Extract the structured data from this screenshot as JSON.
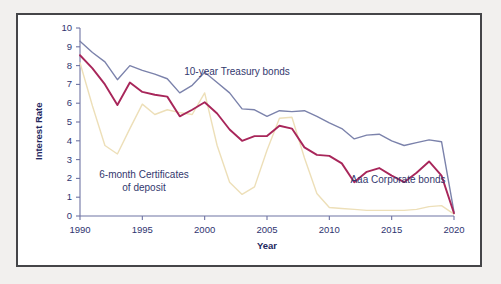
{
  "figure": {
    "background": "#f2f0ee",
    "panel_background": "#ffffff",
    "border_color": "#454548",
    "text_color": "#2f3470"
  },
  "chart_data": {
    "type": "line",
    "title": "",
    "xlabel": "Year",
    "ylabel": "Interest Rate",
    "xlim": [
      1990,
      2020
    ],
    "ylim": [
      0,
      10
    ],
    "xticks": [
      1990,
      1995,
      2000,
      2005,
      2010,
      2015,
      2020
    ],
    "xtick_labels": [
      "1990",
      "1995",
      "2000",
      "2005",
      "2010",
      "2015",
      "2020"
    ],
    "yticks": [
      0,
      1,
      2,
      3,
      4,
      5,
      6,
      7,
      8,
      9,
      10
    ],
    "ytick_labels": [
      "0",
      "1",
      "2",
      "3",
      "4",
      "5",
      "6",
      "7",
      "8",
      "9",
      "10"
    ],
    "grid": false,
    "legend_position": "inline-annotations",
    "x": [
      1990,
      1991,
      1992,
      1993,
      1994,
      1995,
      1996,
      1997,
      1998,
      1999,
      2000,
      2001,
      2002,
      2003,
      2004,
      2005,
      2006,
      2007,
      2008,
      2009,
      2010,
      2011,
      2012,
      2013,
      2014,
      2015,
      2016,
      2017,
      2018,
      2019,
      2020
    ],
    "series": [
      {
        "name": "10-year Treasury bonds",
        "color": "#7b82ab",
        "values": [
          9.3,
          8.7,
          8.2,
          7.25,
          8.0,
          7.75,
          7.55,
          7.3,
          6.55,
          6.95,
          7.65,
          7.1,
          6.55,
          5.7,
          5.65,
          5.3,
          5.6,
          5.55,
          5.6,
          5.3,
          4.95,
          4.65,
          4.1,
          4.3,
          4.35,
          4.0,
          3.75,
          3.9,
          4.05,
          3.95,
          0.2
        ]
      },
      {
        "name": "Aaa Corporate bonds",
        "color": "#a8265a",
        "values": [
          8.55,
          7.85,
          7.0,
          5.9,
          7.1,
          6.6,
          6.45,
          6.35,
          5.3,
          5.65,
          6.05,
          5.45,
          4.6,
          4.0,
          4.25,
          4.25,
          4.8,
          4.65,
          3.65,
          3.25,
          3.2,
          2.8,
          1.8,
          2.35,
          2.55,
          2.15,
          1.8,
          2.3,
          2.9,
          2.15,
          0.15
        ]
      },
      {
        "name": "6-month Certificates of deposit",
        "color": "#eddfb8",
        "values": [
          8.15,
          5.85,
          3.75,
          3.3,
          4.65,
          5.95,
          5.4,
          5.65,
          5.5,
          5.4,
          6.55,
          3.75,
          1.8,
          1.15,
          1.55,
          3.5,
          5.2,
          5.25,
          3.1,
          1.2,
          0.45,
          0.4,
          0.35,
          0.3,
          0.3,
          0.3,
          0.3,
          0.35,
          0.5,
          0.55,
          0.1
        ]
      }
    ],
    "annotations": [
      {
        "text": "10-year Treasury bonds",
        "x_px": 219,
        "y_px": 64,
        "color": "#33386e"
      },
      {
        "text": "6-month Certificates",
        "x_px": 126,
        "y_px": 167,
        "color": "#33386e"
      },
      {
        "text": "of deposit",
        "x_px": 126,
        "y_px": 180,
        "color": "#33386e"
      },
      {
        "text": "Aaa Corporate bonds",
        "x_px": 380,
        "y_px": 172,
        "color": "#33386e"
      }
    ]
  }
}
